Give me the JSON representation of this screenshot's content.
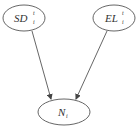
{
  "diagram": {
    "type": "directed-graph",
    "nodes": [
      {
        "id": "sd",
        "label": "SD",
        "superscript": "t",
        "subscript": "i",
        "cx": 24,
        "cy": 18,
        "rx": 21,
        "ry": 13
      },
      {
        "id": "el",
        "label": "EL",
        "superscript": "t",
        "subscript": "i",
        "cx": 114,
        "cy": 18,
        "rx": 21,
        "ry": 13
      },
      {
        "id": "n",
        "label": "N",
        "superscript": "",
        "subscript": "i",
        "cx": 64,
        "cy": 112,
        "rx": 26,
        "ry": 13
      }
    ],
    "edges": [
      {
        "from": "sd",
        "to": "n"
      },
      {
        "from": "el",
        "to": "n"
      }
    ],
    "colors": {
      "stroke": "#555555",
      "text": "#333333",
      "background": "#ffffff"
    }
  }
}
